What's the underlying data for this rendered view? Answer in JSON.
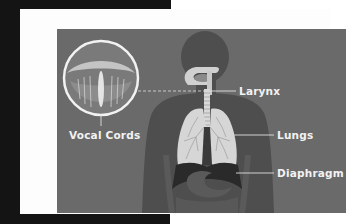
{
  "diagram": {
    "type": "anatomical-illustration",
    "labels": {
      "vocal_cords": "Vocal Cords",
      "larynx": "Larynx",
      "lungs": "Lungs",
      "diaphragm": "Diaphragm"
    },
    "colors": {
      "outer_background": "#141414",
      "frame": "#fdfdfd",
      "panel": "#6a6a6a",
      "body_silhouette": "#4e4e4e",
      "organs_light": "#d6d6d6",
      "diaphragm": "#2a2a2a",
      "stomach": "#5a5a5a",
      "label_text": "#f2f2f2"
    }
  }
}
